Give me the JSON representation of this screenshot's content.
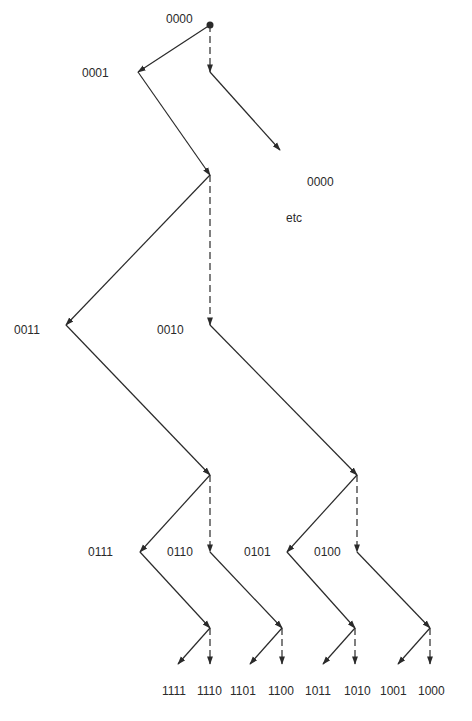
{
  "diagram": {
    "type": "binary-sequence-tree",
    "root": {
      "label": "0000",
      "x": 210,
      "y": 25
    },
    "labels": [
      {
        "id": "root",
        "text": "0000",
        "x": 166,
        "y": 23
      },
      {
        "id": "n0001",
        "text": "0001",
        "x": 82,
        "y": 77
      },
      {
        "id": "n0000b",
        "text": "0000",
        "x": 307,
        "y": 186
      },
      {
        "id": "etc",
        "text": "etc",
        "x": 286,
        "y": 222
      },
      {
        "id": "n0011",
        "text": "0011",
        "x": 14,
        "y": 334
      },
      {
        "id": "n0010",
        "text": "0010",
        "x": 157,
        "y": 334
      },
      {
        "id": "n0111",
        "text": "0111",
        "x": 88,
        "y": 556
      },
      {
        "id": "n0110",
        "text": "0110",
        "x": 167,
        "y": 556
      },
      {
        "id": "n0101",
        "text": "0101",
        "x": 244,
        "y": 556
      },
      {
        "id": "n0100",
        "text": "0100",
        "x": 314,
        "y": 556
      }
    ],
    "leaves": [
      "1111",
      "1110",
      "1101",
      "1100",
      "1011",
      "1010",
      "1001",
      "1000"
    ],
    "leaf_positions": [
      162,
      197,
      230,
      268,
      305,
      344,
      380,
      418
    ],
    "leaf_y": 695,
    "edges": [
      {
        "style": "solid",
        "from": [
          210,
          25
        ],
        "to": [
          138,
          72
        ]
      },
      {
        "style": "dash",
        "from": [
          210,
          25
        ],
        "to": [
          210,
          72
        ]
      },
      {
        "style": "solid",
        "from": [
          138,
          72
        ],
        "to": [
          210,
          175
        ]
      },
      {
        "style": "solid",
        "from": [
          210,
          72
        ],
        "to": [
          280,
          150
        ]
      },
      {
        "style": "solid",
        "from": [
          210,
          175
        ],
        "to": [
          66,
          325
        ]
      },
      {
        "style": "dash",
        "from": [
          210,
          175
        ],
        "to": [
          210,
          325
        ]
      },
      {
        "style": "solid",
        "from": [
          66,
          325
        ],
        "to": [
          210,
          475
        ]
      },
      {
        "style": "solid",
        "from": [
          210,
          325
        ],
        "to": [
          357,
          475
        ]
      },
      {
        "style": "solid",
        "from": [
          210,
          475
        ],
        "to": [
          140,
          552
        ]
      },
      {
        "style": "dash",
        "from": [
          210,
          475
        ],
        "to": [
          210,
          552
        ]
      },
      {
        "style": "solid",
        "from": [
          357,
          475
        ],
        "to": [
          287,
          552
        ]
      },
      {
        "style": "dash",
        "from": [
          357,
          475
        ],
        "to": [
          357,
          552
        ]
      },
      {
        "style": "solid",
        "from": [
          140,
          552
        ],
        "to": [
          210,
          628
        ]
      },
      {
        "style": "solid",
        "from": [
          210,
          552
        ],
        "to": [
          282,
          628
        ]
      },
      {
        "style": "solid",
        "from": [
          287,
          552
        ],
        "to": [
          355,
          628
        ]
      },
      {
        "style": "solid",
        "from": [
          357,
          552
        ],
        "to": [
          430,
          628
        ]
      },
      {
        "style": "solid",
        "from": [
          210,
          628
        ],
        "to": [
          178,
          664
        ]
      },
      {
        "style": "dash",
        "from": [
          210,
          628
        ],
        "to": [
          210,
          664
        ]
      },
      {
        "style": "solid",
        "from": [
          282,
          628
        ],
        "to": [
          250,
          664
        ]
      },
      {
        "style": "dash",
        "from": [
          282,
          628
        ],
        "to": [
          282,
          664
        ]
      },
      {
        "style": "solid",
        "from": [
          355,
          628
        ],
        "to": [
          323,
          664
        ]
      },
      {
        "style": "dash",
        "from": [
          355,
          628
        ],
        "to": [
          355,
          664
        ]
      },
      {
        "style": "solid",
        "from": [
          430,
          628
        ],
        "to": [
          398,
          664
        ]
      },
      {
        "style": "dash",
        "from": [
          430,
          628
        ],
        "to": [
          430,
          664
        ]
      }
    ],
    "legend": {
      "solid": "bit 1 / solid arrow",
      "dash": "bit 0 / dashed arrow"
    }
  }
}
